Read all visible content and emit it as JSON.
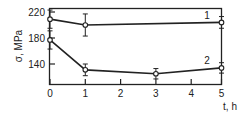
{
  "chart_data": {
    "type": "line",
    "title": "",
    "xlabel": "t, h",
    "ylabel": "σ, MPa",
    "xlim": [
      0,
      5
    ],
    "ylim": [
      110,
      225
    ],
    "x_ticks": [
      0,
      1,
      2,
      3,
      4,
      5
    ],
    "y_ticks": [
      140,
      180,
      220
    ],
    "grid": false,
    "legend": "inline labels near right end of curves",
    "series": [
      {
        "name": "1",
        "x": [
          0,
          1,
          5
        ],
        "values": [
          209,
          200,
          204
        ],
        "error": [
          14,
          17,
          9
        ]
      },
      {
        "name": "2",
        "x": [
          0,
          1,
          3,
          5
        ],
        "values": [
          177,
          131,
          125,
          134
        ],
        "error": [
          14,
          9,
          8,
          8
        ]
      }
    ]
  },
  "labels": {
    "ylabel": "σ, MPa",
    "xlabel": "t, h",
    "series1": "1",
    "series2": "2"
  }
}
